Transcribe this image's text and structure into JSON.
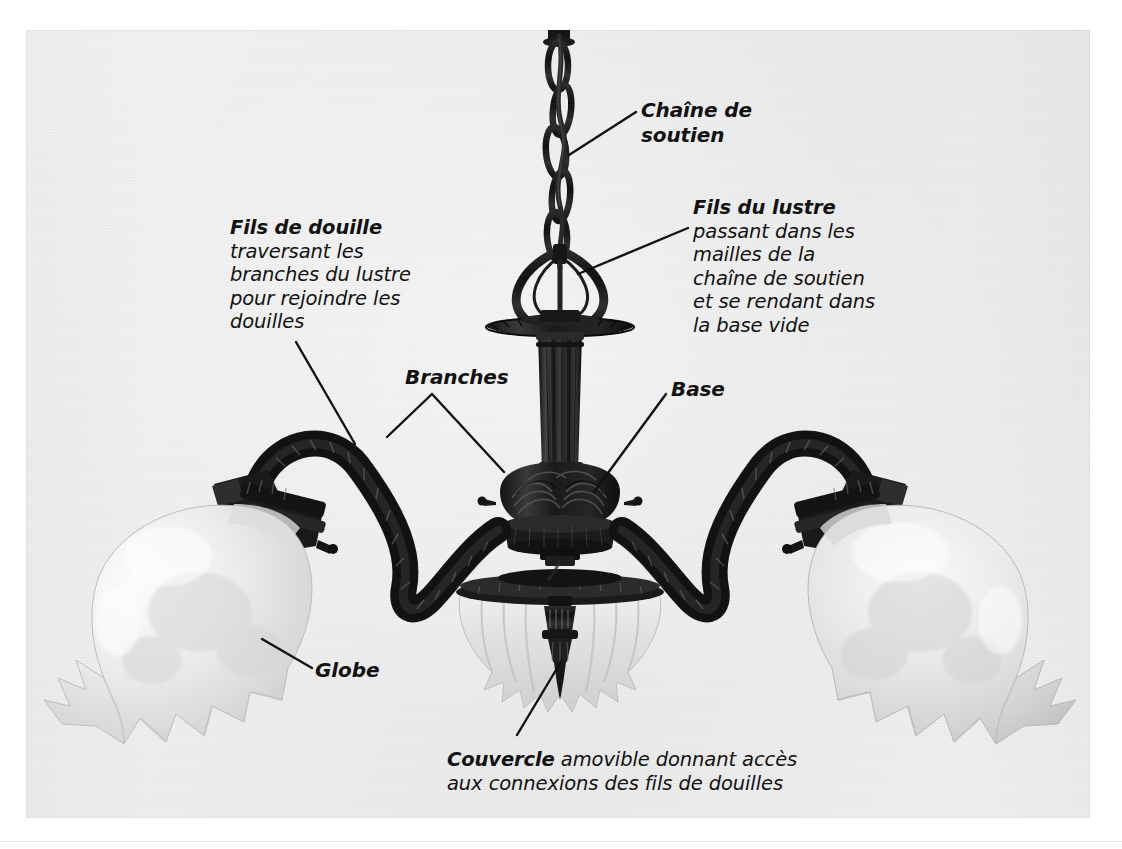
{
  "figure": {
    "kind": "annotated-photograph",
    "language": "fr",
    "background_color": "#ededed",
    "page_color": "#ffffff",
    "text_color": "#121212",
    "leader_line_color": "#111111"
  },
  "annotations": {
    "chaine": {
      "heading": "Chaîne de",
      "heading2": "soutien",
      "full": "Chaîne de\nsoutien"
    },
    "fils_lustre": {
      "heading": "Fils du lustre",
      "body": "passant dans les\nmailles de la\nchaîne de soutien\net se rendant dans\nla base vide"
    },
    "fils_douille": {
      "heading": "Fils de douille",
      "body": "traversant les\nbranches du lustre\npour rejoindre les\ndouilles"
    },
    "branches": {
      "heading": "Branches"
    },
    "base": {
      "heading": "Base"
    },
    "globe": {
      "heading": "Globe"
    },
    "couvercle": {
      "heading": "Couvercle",
      "body": " amovible donnant accès\naux connexions des fils de douilles"
    }
  },
  "parts": [
    {
      "id": "chaine-de-soutien",
      "label": "Chaîne de soutien"
    },
    {
      "id": "fils-du-lustre",
      "label": "Fils du lustre"
    },
    {
      "id": "fils-de-douille",
      "label": "Fils de douille"
    },
    {
      "id": "branches",
      "label": "Branches"
    },
    {
      "id": "base",
      "label": "Base"
    },
    {
      "id": "globe",
      "label": "Globe"
    },
    {
      "id": "couvercle",
      "label": "Couvercle"
    }
  ]
}
